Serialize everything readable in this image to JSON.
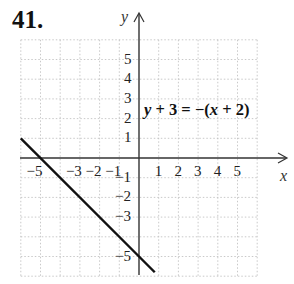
{
  "problem_number": "41.",
  "equation": {
    "text": "y + 3 = −(x + 2)",
    "lhs_var": "y",
    "lhs_rest": " + 3 = −(",
    "rhs_var": "x",
    "rhs_rest": " + 2)"
  },
  "axes": {
    "x_label": "x",
    "y_label": "y"
  },
  "x_ticks": [
    {
      "label": "−5",
      "value": -5
    },
    {
      "label": "−3",
      "value": -3
    },
    {
      "label": "−2",
      "value": -2
    },
    {
      "label": "−1",
      "value": -1
    },
    {
      "label": "1",
      "value": 1
    },
    {
      "label": "2",
      "value": 2
    },
    {
      "label": "3",
      "value": 3
    },
    {
      "label": "4",
      "value": 4
    },
    {
      "label": "5",
      "value": 5
    }
  ],
  "y_ticks": [
    {
      "label": "5",
      "value": 5
    },
    {
      "label": "4",
      "value": 4
    },
    {
      "label": "3",
      "value": 3
    },
    {
      "label": "2",
      "value": 2
    },
    {
      "label": "1",
      "value": 1
    },
    {
      "label": "−1",
      "value": -1
    },
    {
      "label": "−2",
      "value": -2
    },
    {
      "label": "−3",
      "value": -3
    },
    {
      "label": "−5",
      "value": -5
    }
  ],
  "chart_data": {
    "type": "line",
    "title": "y + 3 = −(x + 2)",
    "xlabel": "x",
    "ylabel": "y",
    "xlim": [
      -6,
      6
    ],
    "ylim": [
      -6,
      6
    ],
    "grid": true,
    "series": [
      {
        "name": "y = −x − 5",
        "x": [
          -6,
          0.8
        ],
        "y": [
          1,
          -5.8
        ]
      }
    ],
    "intercepts": {
      "x_intercept": -5,
      "y_intercept": -5
    }
  }
}
